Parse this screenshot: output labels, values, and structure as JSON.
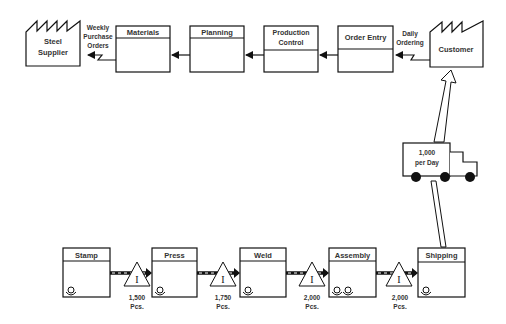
{
  "diagram": {
    "type": "value-stream-map",
    "colors": {
      "stroke": "#111111",
      "text": "#333333",
      "background": "#ffffff"
    },
    "supplier": {
      "line1": "Steel",
      "line2": "Supplier",
      "icon": "factory-icon"
    },
    "customer": {
      "label": "Customer",
      "icon": "factory-icon"
    },
    "supplier_flow": {
      "line1": "Weekly",
      "line2": "Purchase",
      "line3": "Orders",
      "icon": "electronic-info-flow-icon"
    },
    "customer_flow": {
      "line1": "Daily",
      "line2": "Ordering",
      "icon": "electronic-info-flow-icon"
    },
    "info_boxes": [
      {
        "line1": "Materials",
        "line2": ""
      },
      {
        "line1": "Planning",
        "line2": ""
      },
      {
        "line1": "Production",
        "line2": "Control"
      },
      {
        "line1": "Order Entry",
        "line2": ""
      }
    ],
    "truck": {
      "line1": "1,000",
      "line2": "per Day",
      "icon": "truck-icon"
    },
    "processes": [
      {
        "label": "Stamp",
        "operators": 1
      },
      {
        "label": "Press",
        "operators": 1
      },
      {
        "label": "Weld",
        "operators": 1
      },
      {
        "label": "Assembly",
        "operators": 2
      },
      {
        "label": "Shipping",
        "operators": 1
      }
    ],
    "inventories": [
      {
        "symbol": "I",
        "qty": "1,500",
        "unit": "Pcs."
      },
      {
        "symbol": "I",
        "qty": "1,750",
        "unit": "Pcs."
      },
      {
        "symbol": "I",
        "qty": "2,000",
        "unit": "Pcs."
      },
      {
        "symbol": "I",
        "qty": "2,000",
        "unit": "Pcs."
      }
    ]
  }
}
